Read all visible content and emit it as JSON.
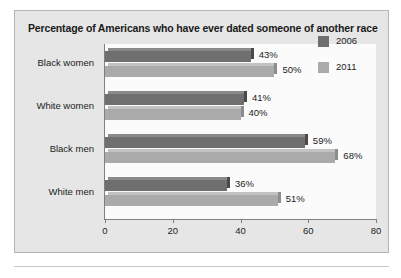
{
  "chart_data": {
    "type": "bar",
    "orientation": "horizontal",
    "title": "Percentage of Americans who have ever dated someone of another race",
    "categories": [
      "Black women",
      "White women",
      "Black men",
      "White men"
    ],
    "series": [
      {
        "name": "2006",
        "color": "#6f6f6f",
        "values": [
          43,
          41,
          59,
          36
        ],
        "labels": [
          "43%",
          "41%",
          "59%",
          "36%"
        ]
      },
      {
        "name": "2011",
        "color": "#aaaaaa",
        "values": [
          50,
          40,
          68,
          51
        ],
        "labels": [
          "50%",
          "40%",
          "68%",
          "51%"
        ]
      }
    ],
    "xlabel": "",
    "ylabel": "",
    "xlim": [
      0,
      80
    ],
    "xticks": [
      0,
      20,
      40,
      60,
      80
    ],
    "xtick_labels": [
      "0",
      "20",
      "40",
      "60",
      "80"
    ],
    "grid": false,
    "legend_position": "right-top"
  },
  "legend": {
    "items": [
      {
        "label": "2006",
        "color": "#6f6f6f"
      },
      {
        "label": "2011",
        "color": "#aaaaaa"
      }
    ]
  },
  "colors": {
    "frame_background": "#e6e6e6",
    "plot_background": "#fbfbfb",
    "axis": "#808080",
    "text": "#1c1c1c",
    "series_2006": "#6f6f6f",
    "series_2011": "#aaaaaa"
  }
}
